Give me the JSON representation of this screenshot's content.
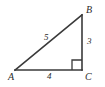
{
  "figure": {
    "kind": "right-triangle-diagram",
    "background_color": "#ffffff",
    "stroke_color": "#3a3a3a",
    "text_color": "#2b2b2b",
    "vertices": [
      {
        "name": "A",
        "label": "A",
        "x": 15,
        "y": 70
      },
      {
        "name": "B",
        "label": "B",
        "x": 82,
        "y": 15
      },
      {
        "name": "C",
        "label": "C",
        "x": 82,
        "y": 70
      }
    ],
    "sides": [
      {
        "name": "hypotenuse-AB",
        "label": "5",
        "from": "A",
        "to": "B"
      },
      {
        "name": "leg-BC",
        "label": "3",
        "from": "B",
        "to": "C"
      },
      {
        "name": "leg-AC",
        "label": "4",
        "from": "A",
        "to": "C"
      }
    ],
    "right_angle": {
      "at_vertex": "C",
      "marker": "square"
    }
  }
}
